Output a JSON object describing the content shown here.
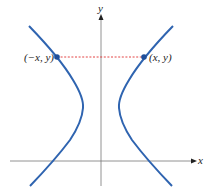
{
  "figure": {
    "axes": {
      "x_label": "x",
      "y_label": "y"
    },
    "points": [
      {
        "label": "(−x, y)",
        "x": 57,
        "y": 57
      },
      {
        "label": "(x, y)",
        "x": 144,
        "y": 57
      }
    ],
    "colors": {
      "curve": "#2f64b0",
      "connector": "#e03030",
      "axis": "#444444",
      "point": "#1f4f9a"
    }
  }
}
